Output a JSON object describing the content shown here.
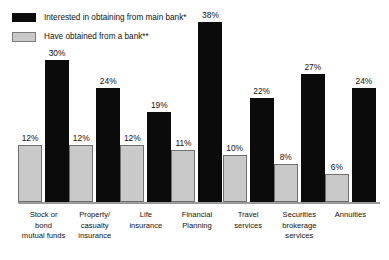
{
  "chart_data": {
    "type": "bar",
    "title": "",
    "subtitle": "",
    "xlabel": "",
    "ylabel": "",
    "ylim": [
      0,
      40
    ],
    "grid": false,
    "legend_position": "top-left",
    "value_suffix": "%",
    "categories": [
      "Stock or bond mutual funds",
      "Property/casualty insurance",
      "Life insurance",
      "Financial Planning",
      "Travel services",
      "Securities brokerage services",
      "Annuities"
    ],
    "category_lines": [
      [
        "Stock or",
        "bond",
        "mutual funds"
      ],
      [
        "Property/",
        "casualty",
        "insurance"
      ],
      [
        "Life",
        "insurance"
      ],
      [
        "Financial",
        "Planning"
      ],
      [
        "Travel",
        "services"
      ],
      [
        "Securities",
        "brokerage",
        "services"
      ],
      [
        "Annuities"
      ]
    ],
    "series": [
      {
        "name": "Have obtained from a bank**",
        "color": "#c9c9c9",
        "border_color": "#6f6f6f",
        "values": [
          12,
          12,
          12,
          11,
          10,
          8,
          6
        ],
        "labels": [
          "12%",
          "12%",
          "12%",
          "11%",
          "10%",
          "8%",
          "6%"
        ]
      },
      {
        "name": "Interested in obtaining from main bank*",
        "color": "#0b0b0b",
        "border_color": "#0b0b0b",
        "values": [
          30,
          24,
          19,
          38,
          22,
          27,
          24
        ],
        "labels": [
          "30%",
          "24%",
          "19%",
          "38%",
          "22%",
          "27%",
          "24%"
        ]
      }
    ]
  },
  "legend": {
    "items": [
      {
        "label": "Interested in obtaining from main bank*",
        "swatch": "dark"
      },
      {
        "label": "Have obtained from a bank**",
        "swatch": "light"
      }
    ]
  }
}
